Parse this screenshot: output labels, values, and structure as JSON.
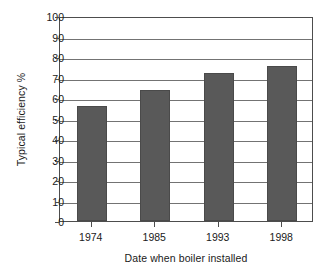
{
  "chart_data": {
    "type": "bar",
    "title": "",
    "categories": [
      "1974",
      "1985",
      "1993",
      "1998"
    ],
    "values": [
      56,
      64,
      72,
      75.5
    ],
    "xlabel": "Date when boiler installed",
    "ylabel": "Typical efficiency %",
    "ylim": [
      0,
      100
    ],
    "ytick_step": 10,
    "yticks": [
      "100",
      "90",
      "80",
      "70",
      "60",
      "50",
      "40",
      "30",
      "20",
      "10",
      "0"
    ],
    "grid": "horizontal",
    "legend": "none",
    "bar_color": "#595959",
    "bar_edge_color": "#4a4a4a",
    "gridline_color": "#737373",
    "frame_color": "#4d4d4d",
    "background": "#ffffff"
  }
}
